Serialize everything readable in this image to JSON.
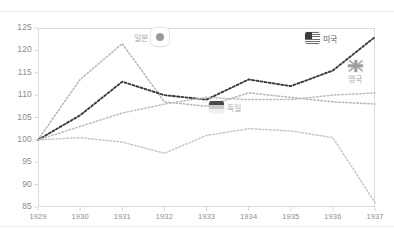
{
  "chart_data": {
    "type": "line",
    "title": "",
    "xlabel": "",
    "ylabel": "",
    "x": [
      1929,
      1930,
      1931,
      1932,
      1933,
      1934,
      1935,
      1936,
      1937
    ],
    "xticklabels": [
      "1929",
      "1930",
      "1931",
      "1932",
      "1933",
      "1934",
      "1935",
      "1936",
      "1937"
    ],
    "yticklabels": [
      "85",
      "90",
      "95",
      "100",
      "105",
      "110",
      "115",
      "120",
      "125"
    ],
    "yticks": [
      85,
      90,
      95,
      100,
      105,
      110,
      115,
      120,
      125
    ],
    "xlim": [
      1929,
      1937
    ],
    "ylim": [
      85,
      125
    ],
    "grid": false,
    "legend_position": "inline-annotations",
    "line_style": "dotted",
    "series": [
      {
        "name": "일본",
        "key": "japan",
        "color": "#b5b5b5",
        "flag": "japan-flag",
        "values": [
          100,
          113.5,
          121.5,
          108.5,
          107.5,
          110.5,
          109.5,
          108.5,
          108.0
        ]
      },
      {
        "name": "미국",
        "key": "usa",
        "color": "#3a3a3a",
        "flag": "usa-flag",
        "values": [
          100,
          105.5,
          113.0,
          110.0,
          109.0,
          113.5,
          112.0,
          115.5,
          123.0
        ]
      },
      {
        "name": "영국",
        "key": "uk",
        "color": "#bdbdbd",
        "flag": "uk-flag",
        "values": [
          100,
          103.0,
          106.0,
          108.0,
          109.5,
          109.0,
          109.0,
          110.0,
          110.5
        ]
      },
      {
        "name": "독일",
        "key": "germany",
        "color": "#c6c6c6",
        "flag": "germany-flag",
        "values": [
          100,
          100.5,
          99.5,
          97.0,
          101.0,
          102.5,
          102.0,
          100.5,
          86.0
        ]
      }
    ]
  },
  "legend": {
    "japan": {
      "label": "일본",
      "icon": "japan-flag-badge"
    },
    "usa": {
      "label": "미국",
      "icon": "usa-flag"
    },
    "uk": {
      "label": "영국",
      "icon": "uk-flag"
    },
    "germany": {
      "label": "독일",
      "icon": "germany-flag"
    }
  }
}
